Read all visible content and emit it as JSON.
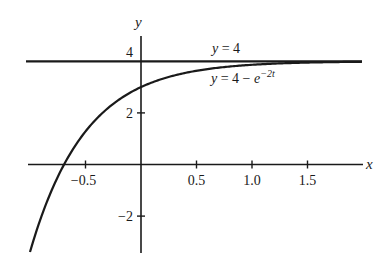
{
  "chart_data": {
    "type": "line",
    "title": "",
    "xlabel": "x",
    "ylabel": "y",
    "xlim": [
      -1.0,
      2.0
    ],
    "ylim": [
      -3.8,
      4.8
    ],
    "grid": false,
    "legend": null,
    "x_ticks": [
      -0.5,
      0.5,
      1.0,
      1.5
    ],
    "x_tick_labels": [
      "−0.5",
      "0.5",
      "1.0",
      "1.5"
    ],
    "y_ticks": [
      -2,
      2,
      4
    ],
    "y_tick_labels": [
      "−2",
      "2",
      "4"
    ],
    "series": [
      {
        "name": "y = 4",
        "kind": "horizontal-asymptote",
        "x": [
          -1.02,
          1.99
        ],
        "y": [
          4,
          4
        ]
      },
      {
        "name": "y = 4 − e^(−2t)",
        "kind": "curve",
        "formula": "4 - exp(-2t)",
        "x": [
          -1.0,
          -0.9,
          -0.8,
          -0.693,
          -0.6,
          -0.5,
          -0.4,
          -0.3,
          -0.2,
          -0.1,
          0.0,
          0.25,
          0.5,
          0.75,
          1.0,
          1.25,
          1.5,
          1.75,
          1.99
        ],
        "y": [
          -3.39,
          -2.05,
          -0.95,
          0.0,
          0.68,
          1.28,
          1.77,
          2.18,
          2.51,
          2.78,
          3.0,
          3.39,
          3.63,
          3.78,
          3.86,
          3.92,
          3.95,
          3.97,
          3.98
        ]
      }
    ],
    "annotations": [
      {
        "text": "y = 4",
        "near": "asymptote, above line at x≈0.9"
      },
      {
        "text": "y = 4 − e^(−2t)",
        "near": "below line at x≈0.9"
      }
    ]
  },
  "labels": {
    "x_axis": "x",
    "y_axis": "y",
    "asymptote": {
      "var": "y",
      "eq": " = 4"
    },
    "curve": {
      "var": "y",
      "eq": " = 4 − ",
      "base": "e",
      "exp": "−2t"
    }
  }
}
